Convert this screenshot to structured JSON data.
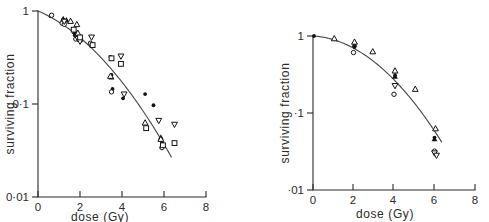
{
  "figure": {
    "background_color": "#ffffff",
    "ink_color": "#1a1a1a",
    "curve_color": "#4a4a4a",
    "panel_count": 2
  },
  "chart_data": [
    {
      "panel": "left",
      "type": "scatter",
      "title": "",
      "xlabel": "dose  (Gy)",
      "ylabel": "surviving fraction",
      "xlim": [
        0,
        8
      ],
      "ylim": [
        0.01,
        1
      ],
      "yscale": "log",
      "grid": false,
      "legend": "none",
      "xticks": [
        0,
        2,
        4,
        6,
        8
      ],
      "xticklabels": [
        "0",
        "2",
        "4",
        "6",
        "8"
      ],
      "yticks": [
        1,
        0.1,
        0.01
      ],
      "yticklabels": [
        "1",
        "0·1",
        "0·01"
      ],
      "fit_curve": {
        "name": "linear-quadratic fit",
        "model": "SF = exp(-alpha*D - beta*D^2)",
        "alpha": 0.22,
        "beta": 0.055,
        "d_start": 0.0,
        "d_end": 6.35
      },
      "series": [
        {
          "name": "filled-circle",
          "marker": "filled-circle",
          "points": [
            {
              "dose": 0.6,
              "sf": 0.88
            },
            {
              "dose": 1.2,
              "sf": 0.8
            },
            {
              "dose": 1.7,
              "sf": 0.62
            },
            {
              "dose": 1.75,
              "sf": 0.55
            },
            {
              "dose": 2.0,
              "sf": 0.52
            },
            {
              "dose": 2.05,
              "sf": 0.48
            },
            {
              "dose": 3.45,
              "sf": 0.32
            },
            {
              "dose": 3.5,
              "sf": 0.205
            },
            {
              "dose": 3.55,
              "sf": 0.145
            },
            {
              "dose": 4.05,
              "sf": 0.115
            },
            {
              "dose": 5.1,
              "sf": 0.128
            },
            {
              "dose": 5.5,
              "sf": 0.097
            },
            {
              "dose": 5.85,
              "sf": 0.042
            },
            {
              "dose": 5.9,
              "sf": 0.039
            }
          ]
        },
        {
          "name": "open-circle",
          "marker": "open-circle",
          "points": [
            {
              "dose": 0.65,
              "sf": 0.9
            },
            {
              "dose": 1.15,
              "sf": 0.74
            },
            {
              "dose": 1.25,
              "sf": 0.72
            },
            {
              "dose": 1.8,
              "sf": 0.5
            },
            {
              "dose": 2.5,
              "sf": 0.45
            },
            {
              "dose": 3.5,
              "sf": 0.135
            },
            {
              "dose": 5.9,
              "sf": 0.034
            }
          ]
        },
        {
          "name": "filled-triangle-up",
          "marker": "filled-triangle-up",
          "points": [
            {
              "dose": 1.2,
              "sf": 0.83
            },
            {
              "dose": 1.35,
              "sf": 0.8
            },
            {
              "dose": 1.75,
              "sf": 0.6
            },
            {
              "dose": 1.8,
              "sf": 0.58
            },
            {
              "dose": 2.0,
              "sf": 0.53
            },
            {
              "dose": 3.5,
              "sf": 0.195
            },
            {
              "dose": 5.85,
              "sf": 0.044
            }
          ]
        },
        {
          "name": "open-triangle-up",
          "marker": "open-triangle-up",
          "points": [
            {
              "dose": 1.55,
              "sf": 0.78
            },
            {
              "dose": 1.85,
              "sf": 0.72
            },
            {
              "dose": 1.9,
              "sf": 0.58
            },
            {
              "dose": 3.45,
              "sf": 0.2
            },
            {
              "dose": 5.1,
              "sf": 0.063
            },
            {
              "dose": 5.85,
              "sf": 0.042
            }
          ]
        },
        {
          "name": "open-triangle-down",
          "marker": "open-triangle-down",
          "points": [
            {
              "dose": 1.25,
              "sf": 0.77
            },
            {
              "dose": 1.9,
              "sf": 0.5
            },
            {
              "dose": 2.0,
              "sf": 0.47
            },
            {
              "dose": 2.55,
              "sf": 0.52
            },
            {
              "dose": 3.95,
              "sf": 0.325
            },
            {
              "dose": 4.1,
              "sf": 0.127
            },
            {
              "dose": 5.75,
              "sf": 0.066
            },
            {
              "dose": 6.5,
              "sf": 0.06
            }
          ]
        },
        {
          "name": "open-square",
          "marker": "open-square",
          "points": [
            {
              "dose": 1.7,
              "sf": 0.63
            },
            {
              "dose": 2.0,
              "sf": 0.52
            },
            {
              "dose": 2.6,
              "sf": 0.43
            },
            {
              "dose": 3.5,
              "sf": 0.31
            },
            {
              "dose": 3.95,
              "sf": 0.27
            },
            {
              "dose": 5.15,
              "sf": 0.055
            },
            {
              "dose": 5.95,
              "sf": 0.036
            },
            {
              "dose": 6.5,
              "sf": 0.038
            }
          ]
        }
      ]
    },
    {
      "panel": "right",
      "type": "scatter",
      "title": "",
      "xlabel": "dose  (Gy)",
      "ylabel": "surviving  fraction",
      "xlim": [
        0,
        8
      ],
      "ylim": [
        0.01,
        1
      ],
      "yscale": "log",
      "grid": false,
      "legend": "none",
      "xticks": [
        0,
        2,
        4,
        6,
        8
      ],
      "xticklabels": [
        "0",
        "2",
        "4",
        "6",
        "8"
      ],
      "yticks": [
        1,
        0.1,
        0.01
      ],
      "yticklabels": [
        "1",
        "·1",
        "·01"
      ],
      "fit_curve": {
        "name": "linear-quadratic fit",
        "model": "SF = exp(-alpha*D - beta*D^2)",
        "alpha": 0.035,
        "beta": 0.073,
        "d_start": 0.0,
        "d_end": 6.35
      },
      "series": [
        {
          "name": "filled-circle",
          "marker": "filled-circle",
          "points": [
            {
              "dose": 0.05,
              "sf": 1.0
            },
            {
              "dose": 2.05,
              "sf": 0.72
            },
            {
              "dose": 4.05,
              "sf": 0.31
            },
            {
              "dose": 6.0,
              "sf": 0.048
            }
          ]
        },
        {
          "name": "open-circle",
          "marker": "open-circle",
          "points": [
            {
              "dose": 2.0,
              "sf": 0.61
            },
            {
              "dose": 4.0,
              "sf": 0.175
            },
            {
              "dose": 6.0,
              "sf": 0.032
            }
          ]
        },
        {
          "name": "filled-triangle-up",
          "marker": "filled-triangle-up",
          "points": [
            {
              "dose": 2.05,
              "sf": 0.78
            },
            {
              "dose": 4.05,
              "sf": 0.3
            },
            {
              "dose": 6.0,
              "sf": 0.046
            }
          ]
        },
        {
          "name": "open-triangle-up",
          "marker": "open-triangle-up",
          "points": [
            {
              "dose": 1.05,
              "sf": 0.93
            },
            {
              "dose": 2.05,
              "sf": 0.84
            },
            {
              "dose": 2.95,
              "sf": 0.63
            },
            {
              "dose": 4.05,
              "sf": 0.355
            },
            {
              "dose": 5.05,
              "sf": 0.205
            },
            {
              "dose": 6.05,
              "sf": 0.063
            }
          ]
        },
        {
          "name": "open-triangle-down",
          "marker": "open-triangle-down",
          "points": [
            {
              "dose": 4.05,
              "sf": 0.225
            },
            {
              "dose": 6.0,
              "sf": 0.03
            },
            {
              "dose": 6.1,
              "sf": 0.028
            }
          ]
        }
      ]
    }
  ]
}
